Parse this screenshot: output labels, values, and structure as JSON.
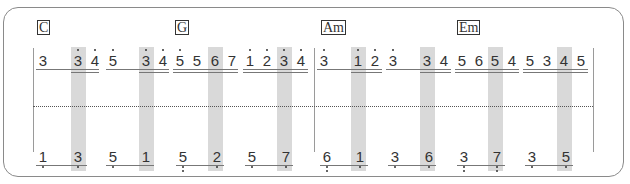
{
  "chords": [
    {
      "label": "C",
      "x": 37
    },
    {
      "label": "G",
      "x": 175
    },
    {
      "label": "Am",
      "x": 321
    },
    {
      "label": "Em",
      "x": 457
    }
  ],
  "highlight_columns_x": [
    71,
    139,
    208,
    277,
    351,
    420,
    488,
    557
  ],
  "barlines_x": [
    33,
    314,
    593
  ],
  "upper_notes": [
    {
      "d": "3",
      "x": 36,
      "hi": 0
    },
    {
      "d": "3",
      "x": 71,
      "hi": 1
    },
    {
      "d": "4",
      "x": 88,
      "hi": 1
    },
    {
      "d": "5",
      "x": 106,
      "hi": 1
    },
    {
      "d": "3",
      "x": 139,
      "hi": 1
    },
    {
      "d": "4",
      "x": 156,
      "hi": 1
    },
    {
      "d": "5",
      "x": 173,
      "hi": 1
    },
    {
      "d": "5",
      "x": 190,
      "hi": 0
    },
    {
      "d": "6",
      "x": 208,
      "hi": 0
    },
    {
      "d": "7",
      "x": 225,
      "hi": 0
    },
    {
      "d": "1",
      "x": 243,
      "hi": 1
    },
    {
      "d": "2",
      "x": 260,
      "hi": 1
    },
    {
      "d": "3",
      "x": 277,
      "hi": 1
    },
    {
      "d": "4",
      "x": 294,
      "hi": 1
    },
    {
      "d": "3",
      "x": 317,
      "hi": 1
    },
    {
      "d": "1",
      "x": 351,
      "hi": 1
    },
    {
      "d": "2",
      "x": 368,
      "hi": 1
    },
    {
      "d": "3",
      "x": 386,
      "hi": 1
    },
    {
      "d": "3",
      "x": 420,
      "hi": 0
    },
    {
      "d": "4",
      "x": 437,
      "hi": 0
    },
    {
      "d": "5",
      "x": 455,
      "hi": 0
    },
    {
      "d": "6",
      "x": 472,
      "hi": 0
    },
    {
      "d": "5",
      "x": 488,
      "hi": 0
    },
    {
      "d": "4",
      "x": 505,
      "hi": 0
    },
    {
      "d": "5",
      "x": 523,
      "hi": 0
    },
    {
      "d": "3",
      "x": 540,
      "hi": 0
    },
    {
      "d": "4",
      "x": 557,
      "hi": 0
    },
    {
      "d": "5",
      "x": 574,
      "hi": 0
    }
  ],
  "upper_underlines": [
    {
      "x": 36,
      "w": 63,
      "double": false
    },
    {
      "x": 71,
      "w": 28,
      "double": true
    },
    {
      "x": 106,
      "w": 63,
      "double": false
    },
    {
      "x": 139,
      "w": 30,
      "double": true
    },
    {
      "x": 173,
      "w": 65,
      "double": true
    },
    {
      "x": 243,
      "w": 65,
      "double": true
    },
    {
      "x": 317,
      "w": 65,
      "double": false
    },
    {
      "x": 351,
      "w": 31,
      "double": true
    },
    {
      "x": 386,
      "w": 65,
      "double": false
    },
    {
      "x": 420,
      "w": 31,
      "double": true
    },
    {
      "x": 455,
      "w": 64,
      "double": true
    },
    {
      "x": 523,
      "w": 65,
      "double": true
    }
  ],
  "lower_notes": [
    {
      "d": "1",
      "x": 36,
      "lo": 1
    },
    {
      "d": "3",
      "x": 71,
      "lo": 1
    },
    {
      "d": "5",
      "x": 106,
      "lo": 1
    },
    {
      "d": "1",
      "x": 139,
      "lo": 0
    },
    {
      "d": "5",
      "x": 176,
      "lo": 2
    },
    {
      "d": "2",
      "x": 210,
      "lo": 1
    },
    {
      "d": "5",
      "x": 245,
      "lo": 1
    },
    {
      "d": "7",
      "x": 279,
      "lo": 1
    },
    {
      "d": "6",
      "x": 320,
      "lo": 2
    },
    {
      "d": "1",
      "x": 353,
      "lo": 1
    },
    {
      "d": "3",
      "x": 388,
      "lo": 1
    },
    {
      "d": "6",
      "x": 422,
      "lo": 1
    },
    {
      "d": "3",
      "x": 457,
      "lo": 2
    },
    {
      "d": "7",
      "x": 490,
      "lo": 2
    },
    {
      "d": "3",
      "x": 525,
      "lo": 1
    },
    {
      "d": "5",
      "x": 559,
      "lo": 1
    }
  ],
  "lower_underlines": [
    {
      "x": 36,
      "w": 51
    },
    {
      "x": 106,
      "w": 48
    },
    {
      "x": 176,
      "w": 48
    },
    {
      "x": 245,
      "w": 48
    },
    {
      "x": 320,
      "w": 48
    },
    {
      "x": 388,
      "w": 48
    },
    {
      "x": 457,
      "w": 48
    },
    {
      "x": 525,
      "w": 48
    }
  ],
  "colors": {
    "highlight": "#d9d9d9",
    "ink": "#333333",
    "frame": "#8a8a8a"
  }
}
